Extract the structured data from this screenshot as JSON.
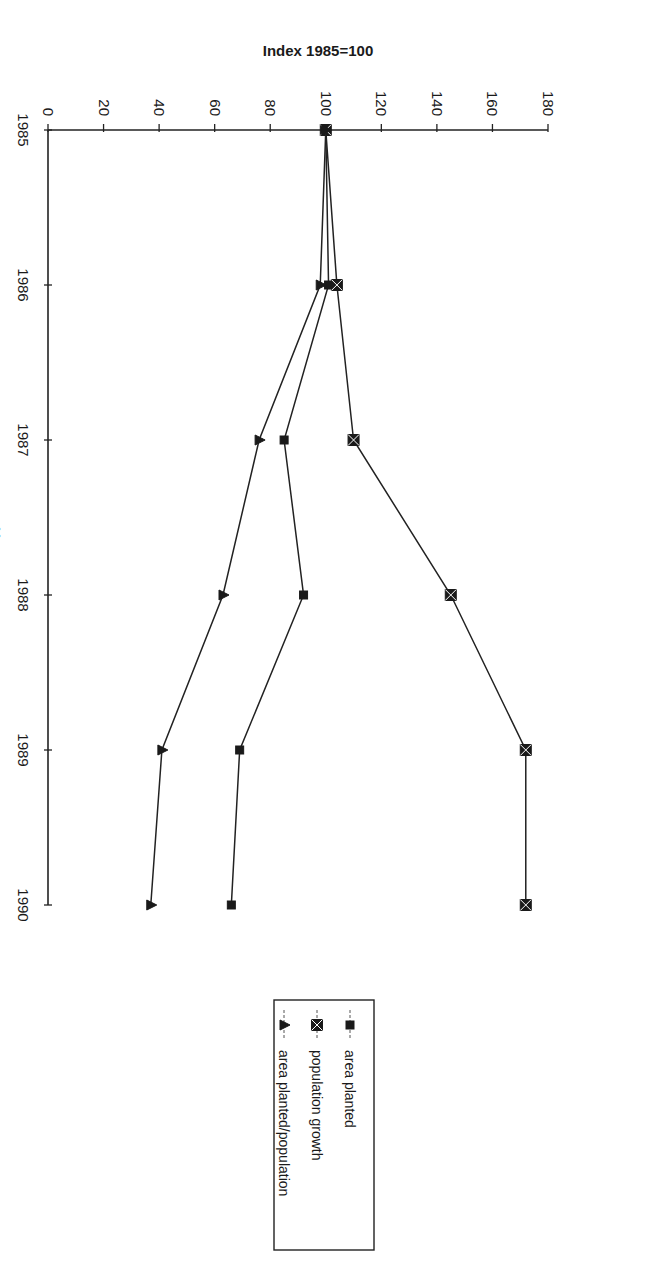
{
  "chart_data": {
    "type": "line",
    "title": "",
    "xlabel": "Years",
    "ylabel": "Index 1985=100",
    "x": [
      "1985",
      "1986",
      "1987",
      "1988",
      "1989",
      "1990"
    ],
    "ylim": [
      0,
      180
    ],
    "yticks": [
      0,
      20,
      40,
      60,
      80,
      100,
      120,
      140,
      160,
      180
    ],
    "grid": false,
    "orientation": "rotated 90 degrees clockwise",
    "legend_position": "top-right",
    "series": [
      {
        "name": "area planted",
        "marker": "square",
        "values": [
          100,
          101,
          85,
          92,
          69,
          66
        ]
      },
      {
        "name": "population growth",
        "marker": "crossed-square",
        "values": [
          100,
          104,
          110,
          145,
          172,
          172
        ]
      },
      {
        "name": "area planted/population",
        "marker": "triangle",
        "values": [
          100,
          98,
          76,
          63,
          41,
          37
        ]
      }
    ]
  }
}
